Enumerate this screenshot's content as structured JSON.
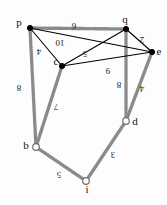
{
  "figure": {
    "kind": "weighted-graph-diagram",
    "orientation": "rotated-180",
    "background": "#fdfdfd",
    "edge_color": "#000000",
    "tree_edge_color": "#8a8a8a",
    "filled_node_color": "#000000",
    "open_node_color": "#ffffff"
  },
  "nodes": [
    {
      "id": "p",
      "label": "p",
      "x": 30,
      "y": 28,
      "style": "filled",
      "label_dx": -11,
      "label_dy": -2
    },
    {
      "id": "q",
      "label": "q",
      "x": 126,
      "y": 29,
      "style": "filled",
      "label_dx": -1,
      "label_dy": -6
    },
    {
      "id": "e",
      "label": "e",
      "x": 152,
      "y": 52,
      "style": "filled",
      "label_dx": 7,
      "label_dy": 3
    },
    {
      "id": "c",
      "label": "c",
      "x": 62,
      "y": 66,
      "style": "filled",
      "label_dx": -6,
      "label_dy": -1
    },
    {
      "id": "d",
      "label": "d",
      "x": 126,
      "y": 121,
      "style": "open",
      "label_dx": 9,
      "label_dy": 4
    },
    {
      "id": "b",
      "label": "b",
      "x": 36,
      "y": 147,
      "style": "open",
      "label_dx": -10,
      "label_dy": 2
    },
    {
      "id": "i",
      "label": "i",
      "x": 86,
      "y": 181,
      "style": "open",
      "label_dx": 1,
      "label_dy": 12
    }
  ],
  "edges": [
    {
      "id": "p-q",
      "from": "p",
      "to": "q",
      "weight": "6",
      "type": "tree",
      "label_x": 74,
      "label_y": 23
    },
    {
      "id": "p-e",
      "from": "p",
      "to": "e",
      "weight": "10",
      "type": "normal",
      "label_x": 60,
      "label_y": 40
    },
    {
      "id": "p-c",
      "from": "p",
      "to": "c",
      "weight": "4",
      "type": "normal",
      "label_x": 39,
      "label_y": 49
    },
    {
      "id": "c-q",
      "from": "c",
      "to": "q",
      "weight": "5",
      "type": "normal",
      "label_x": 85,
      "label_y": 51
    },
    {
      "id": "c-e",
      "from": "c",
      "to": "e",
      "weight": "9",
      "type": "normal",
      "label_x": 108,
      "label_y": 68
    },
    {
      "id": "q-e",
      "from": "q",
      "to": "e",
      "weight": "2",
      "type": "normal",
      "label_x": 142,
      "label_y": 37
    },
    {
      "id": "q-d",
      "from": "q",
      "to": "d",
      "weight": "8",
      "type": "tree",
      "label_x": 119,
      "label_y": 82
    },
    {
      "id": "e-d",
      "from": "e",
      "to": "d",
      "weight": "4",
      "type": "tree",
      "label_x": 142,
      "label_y": 86
    },
    {
      "id": "p-b",
      "from": "p",
      "to": "b",
      "weight": "8",
      "type": "tree",
      "label_x": 19,
      "label_y": 85
    },
    {
      "id": "c-b",
      "from": "c",
      "to": "b",
      "weight": "7",
      "type": "tree",
      "label_x": 56,
      "label_y": 104
    },
    {
      "id": "b-i",
      "from": "b",
      "to": "i",
      "weight": "5",
      "type": "tree",
      "label_x": 59,
      "label_y": 172
    },
    {
      "id": "i-d",
      "from": "i",
      "to": "d",
      "weight": "3",
      "type": "tree",
      "label_x": 113,
      "label_y": 152
    }
  ]
}
